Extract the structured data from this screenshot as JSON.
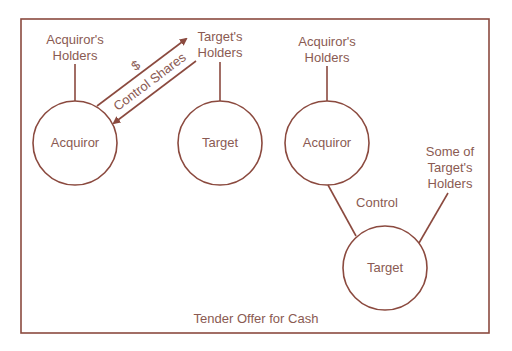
{
  "colors": {
    "stroke": "#8b4a3f",
    "text": "#8a5a52",
    "background": "#ffffff"
  },
  "caption": "Tender Offer for Cash",
  "left_panel": {
    "acquirors_holders": [
      "Acquiror's",
      "Holders"
    ],
    "targets_holders": [
      "Target's",
      "Holders"
    ],
    "acquiror": "Acquiror",
    "target": "Target",
    "arrow_cash": "$",
    "arrow_shares": "Control Shares"
  },
  "right_panel": {
    "acquirors_holders": [
      "Acquiror's",
      "Holders"
    ],
    "acquiror": "Acquiror",
    "target": "Target",
    "control": "Control",
    "some_targets_holders": [
      "Some of",
      "Target's",
      "Holders"
    ]
  }
}
